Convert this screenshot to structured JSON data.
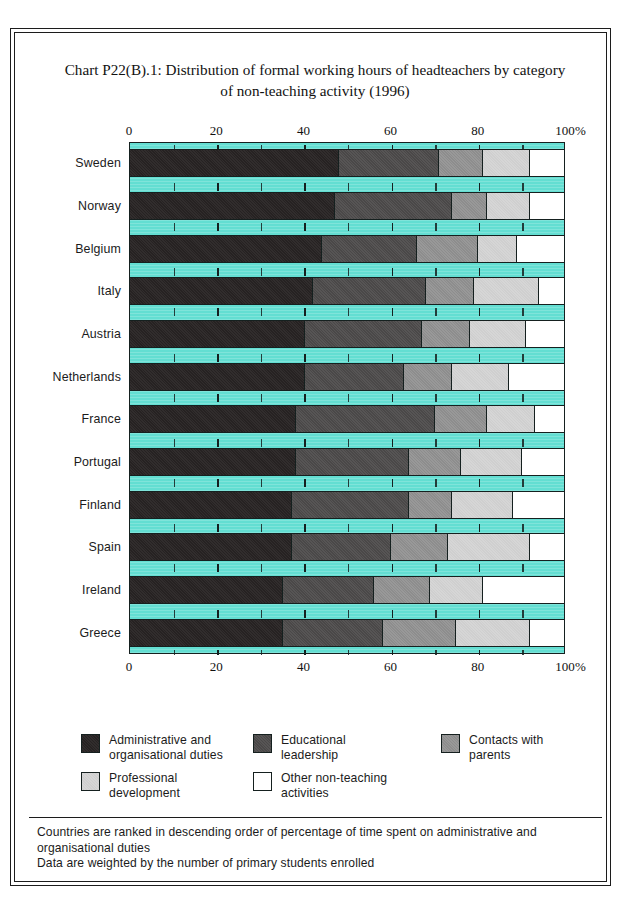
{
  "title": "Chart P22(B).1: Distribution of formal working hours of headteachers by category of non-teaching activity (1996)",
  "title_line1": "Chart P22(B).1: Distribution of formal working hours of headteachers by category",
  "title_line2": "of non-teaching activity (1996)",
  "axis": {
    "ticks": [
      "0",
      "20",
      "40",
      "60",
      "80",
      "100"
    ],
    "unit": "%",
    "minor_step": 10,
    "range": [
      0,
      100
    ]
  },
  "legend": [
    {
      "label": "Administrative and\norganisational duties",
      "color": "#262222",
      "key": "administrative-and-organisational-duties"
    },
    {
      "label": "Educational\nleadership",
      "color": "#4a4848",
      "key": "educational-leadership"
    },
    {
      "label": "Contacts with parents",
      "color": "#8d8d8d",
      "key": "contacts-with-parents"
    },
    {
      "label": "Professional\ndevelopment",
      "color": "#cfcfcf",
      "key": "professional-development"
    },
    {
      "label": "Other non-teaching\nactivities",
      "color": "#ffffff",
      "key": "other-non-teaching-activities"
    }
  ],
  "footnotes": [
    "Countries are ranked in descending order of percentage of time spent on administrative and organisational duties",
    "Data are weighted by the number of primary students enrolled"
  ],
  "colors": {
    "plot_background": "#63ded2",
    "outline": "#15201f",
    "series": [
      "#262222",
      "#4a4848",
      "#8d8d8d",
      "#cfcfcf",
      "#ffffff"
    ]
  },
  "chart_data": {
    "type": "bar",
    "orientation": "horizontal",
    "stacked": true,
    "stack_total": 100,
    "title": "Chart P22(B).1: Distribution of formal working hours of headteachers by category of non-teaching activity (1996)",
    "xlabel": "%",
    "ylabel": "",
    "xlim": [
      0,
      100
    ],
    "xticks": [
      0,
      20,
      40,
      60,
      80,
      100
    ],
    "grid": false,
    "legend_position": "bottom",
    "categories": [
      "Sweden",
      "Norway",
      "Belgium",
      "Italy",
      "Austria",
      "Netherlands",
      "France",
      "Portugal",
      "Finland",
      "Spain",
      "Ireland",
      "Greece"
    ],
    "series": [
      {
        "name": "Administrative and organisational duties",
        "color": "#262222",
        "values": [
          48,
          47,
          44,
          42,
          40,
          40,
          38,
          38,
          37,
          37,
          35,
          35
        ]
      },
      {
        "name": "Educational leadership",
        "color": "#4a4848",
        "values": [
          23,
          27,
          22,
          26,
          27,
          23,
          32,
          26,
          27,
          23,
          21,
          23
        ]
      },
      {
        "name": "Contacts with parents",
        "color": "#8d8d8d",
        "values": [
          10,
          8,
          14,
          11,
          11,
          11,
          12,
          12,
          10,
          13,
          13,
          17
        ]
      },
      {
        "name": "Professional development",
        "color": "#cfcfcf",
        "values": [
          11,
          10,
          9,
          15,
          13,
          13,
          11,
          14,
          14,
          19,
          12,
          17
        ]
      },
      {
        "name": "Other non-teaching activities",
        "color": "#ffffff",
        "values": [
          8,
          8,
          11,
          6,
          9,
          13,
          7,
          10,
          12,
          8,
          19,
          8
        ]
      }
    ]
  }
}
